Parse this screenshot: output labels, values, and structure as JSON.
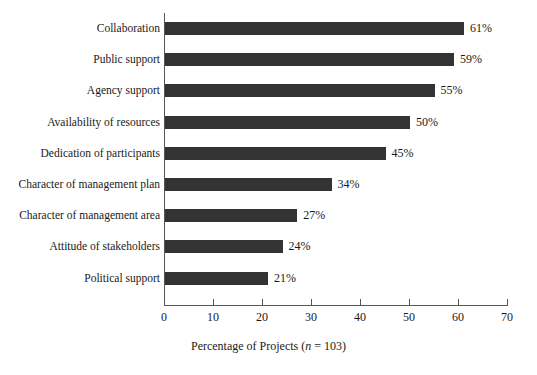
{
  "chart_data": {
    "type": "bar",
    "orientation": "horizontal",
    "title": "",
    "subtitle": "",
    "xlabel": "Percentage of Projects (n = 103)",
    "xlabel_parts": {
      "prefix": "Percentage of Projects (",
      "italic_symbol": "n",
      "suffix": " = 103)"
    },
    "ylabel": "",
    "categories": [
      "Collaboration",
      "Public support",
      "Agency support",
      "Availability of resources",
      "Dedication of participants",
      "Character of management plan",
      "Character of management area",
      "Attitude of stakeholders",
      "Political support"
    ],
    "values": [
      61,
      59,
      55,
      50,
      45,
      34,
      27,
      24,
      21
    ],
    "value_labels": [
      "61%",
      "59%",
      "55%",
      "50%",
      "45%",
      "34%",
      "27%",
      "24%",
      "21%"
    ],
    "xlim": [
      0,
      70
    ],
    "xticks": [
      0,
      10,
      20,
      30,
      40,
      50,
      60,
      70
    ],
    "xtick_labels": [
      "0",
      "10",
      "20",
      "30",
      "40",
      "50",
      "60",
      "70"
    ],
    "grid": false,
    "legend": null,
    "n": 103,
    "colors": {
      "bar_fill": "#333333",
      "axis": "#555555",
      "text": "#1a1a1a",
      "background": "#ffffff"
    }
  }
}
